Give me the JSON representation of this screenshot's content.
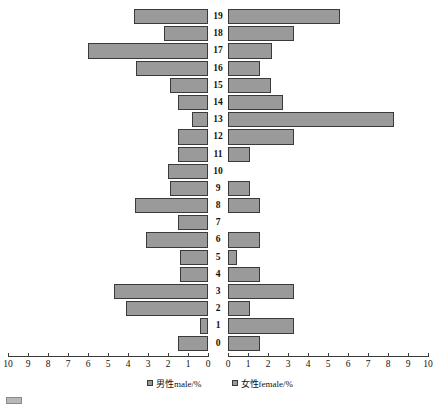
{
  "chart_data": {
    "type": "bar",
    "subtype": "population-pyramid",
    "title": "",
    "xlabel": "",
    "ylabel": "",
    "categories": [
      "0",
      "1",
      "2",
      "3",
      "4",
      "5",
      "6",
      "7",
      "8",
      "9",
      "10",
      "11",
      "12",
      "13",
      "14",
      "15",
      "16",
      "17",
      "18",
      "19"
    ],
    "axis": {
      "left_ticks": [
        10,
        9,
        8,
        7,
        6,
        5,
        4,
        3,
        2,
        1,
        0
      ],
      "right_ticks": [
        0,
        1,
        2,
        3,
        4,
        5,
        6,
        7,
        8,
        9,
        10
      ],
      "xlim": [
        0,
        10
      ],
      "grid": false,
      "legend_position": "bottom"
    },
    "series": [
      {
        "name": "男性male/%",
        "side": "left",
        "color": "#9a9a9a",
        "values": [
          1.5,
          0.4,
          4.1,
          4.7,
          1.4,
          1.4,
          3.1,
          1.5,
          3.65,
          1.9,
          2.0,
          1.5,
          1.5,
          0.8,
          1.5,
          1.9,
          3.6,
          6.0,
          2.2,
          3.7
        ]
      },
      {
        "name": "女性female/%",
        "side": "right",
        "color": "#9a9a9a",
        "values": [
          1.6,
          3.3,
          1.1,
          3.3,
          1.6,
          0.45,
          1.6,
          0.0,
          1.6,
          1.1,
          0.0,
          1.1,
          3.3,
          8.3,
          2.75,
          2.15,
          1.6,
          2.2,
          3.3,
          5.6
        ]
      }
    ]
  },
  "legend": {
    "items": [
      {
        "label": "男性male/%"
      },
      {
        "label": "女性female/%"
      }
    ]
  },
  "caption": {
    "text": ""
  }
}
